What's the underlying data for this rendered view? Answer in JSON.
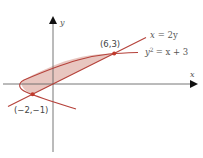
{
  "figure": {
    "type": "region-between-curves",
    "x_axis_label": "x",
    "y_axis_label": "y",
    "curves": [
      {
        "name": "line",
        "equation_lhs": "x",
        "equation_rhs": "= 2y",
        "color": "#b5413a"
      },
      {
        "name": "parabola",
        "equation_lhs": "y",
        "equation_exp": "2",
        "equation_rhs": "= x + 3",
        "color": "#b5413a"
      }
    ],
    "intersection_points": [
      {
        "label": "(6,3)",
        "x": 6,
        "y": 3
      },
      {
        "label": "(−2,−1)",
        "x": -2,
        "y": -1
      }
    ],
    "region_fill": "#e8c6c0",
    "axis_color": "#555555"
  }
}
